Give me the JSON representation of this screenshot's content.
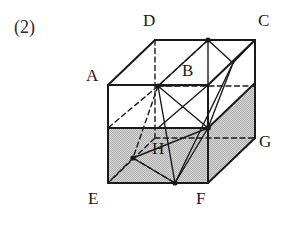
{
  "figure": {
    "part_label": "(2)",
    "shape_name": "rectangular-prism",
    "colors": {
      "stroke": "#1a1a1a",
      "hidden_stroke": "#1a1a1a",
      "shaded_face": "#c8c8c8",
      "background": "#ffffff",
      "label_text": "#1a1a1a"
    },
    "stroke_widths": {
      "solid_edge": 2.0,
      "thin_edge": 1.4,
      "hidden_edge": 1.4
    },
    "vertices": [
      {
        "id": "A",
        "label": "A",
        "x": 108,
        "y": 85,
        "label_x": 86,
        "label_y": 67,
        "hidden": false
      },
      {
        "id": "B",
        "label": "B",
        "x": 158,
        "y": 86,
        "label_x": 182,
        "label_y": 62,
        "hidden": true
      },
      {
        "id": "C",
        "label": "C",
        "x": 255,
        "y": 40,
        "label_x": 258,
        "label_y": 12,
        "hidden": false
      },
      {
        "id": "D",
        "label": "D",
        "x": 155,
        "y": 40,
        "label_x": 143,
        "label_y": 12,
        "hidden": false
      },
      {
        "id": "E",
        "label": "E",
        "x": 108,
        "y": 183,
        "label_x": 88,
        "label_y": 190,
        "hidden": false
      },
      {
        "id": "F",
        "label": "F",
        "x": 208,
        "y": 183,
        "label_x": 196,
        "label_y": 190,
        "hidden": false
      },
      {
        "id": "G",
        "label": "G",
        "x": 255,
        "y": 138,
        "label_x": 259,
        "label_y": 133,
        "hidden": false
      },
      {
        "id": "H",
        "label": "H",
        "x": 133,
        "y": 158,
        "label_x": 152,
        "label_y": 140,
        "hidden": true
      }
    ],
    "shaded_faces": [
      {
        "name": "front-lower-band",
        "points": "108,128 208,128 208,183 108,183"
      },
      {
        "name": "right-lower-band",
        "points": "208,128 255,83 255,138 208,183"
      }
    ],
    "solid_edges": [
      {
        "name": "edge-top-front-left",
        "x1": 108,
        "y1": 85,
        "x2": 155,
        "y2": 40
      },
      {
        "name": "edge-top-back",
        "x1": 155,
        "y1": 40,
        "x2": 255,
        "y2": 40
      },
      {
        "name": "edge-top-front",
        "x1": 108,
        "y1": 85,
        "x2": 208,
        "y2": 85
      },
      {
        "name": "edge-top-right",
        "x1": 208,
        "y1": 85,
        "x2": 255,
        "y2": 40
      },
      {
        "name": "edge-front-left-vert",
        "x1": 108,
        "y1": 85,
        "x2": 108,
        "y2": 183
      },
      {
        "name": "edge-front-right-vert",
        "x1": 208,
        "y1": 85,
        "x2": 208,
        "y2": 183
      },
      {
        "name": "edge-back-right-vert",
        "x1": 255,
        "y1": 40,
        "x2": 255,
        "y2": 138
      },
      {
        "name": "edge-bottom-front",
        "x1": 108,
        "y1": 183,
        "x2": 208,
        "y2": 183
      },
      {
        "name": "edge-bottom-right",
        "x1": 208,
        "y1": 183,
        "x2": 255,
        "y2": 138
      },
      {
        "name": "edge-midline-front",
        "x1": 108,
        "y1": 128,
        "x2": 208,
        "y2": 128
      },
      {
        "name": "edge-midline-right",
        "x1": 208,
        "y1": 128,
        "x2": 255,
        "y2": 83
      }
    ],
    "hidden_edges": [
      {
        "name": "hidden-back-left-vert",
        "x1": 155,
        "y1": 40,
        "x2": 155,
        "y2": 138
      },
      {
        "name": "hidden-back-bottom",
        "x1": 155,
        "y1": 138,
        "x2": 255,
        "y2": 138
      },
      {
        "name": "hidden-back-left-diag",
        "x1": 108,
        "y1": 183,
        "x2": 155,
        "y2": 138
      },
      {
        "name": "hidden-mid-back",
        "x1": 158,
        "y1": 86,
        "x2": 255,
        "y2": 86
      }
    ],
    "construction_solid": [
      {
        "name": "seg-B-to-top-node",
        "x1": 158,
        "y1": 86,
        "x2": 208,
        "y2": 40
      },
      {
        "name": "seg-topnode-to-mid",
        "x1": 208,
        "y1": 40,
        "x2": 233,
        "y2": 63
      },
      {
        "name": "seg-mid-to-C",
        "x1": 233,
        "y1": 63,
        "x2": 255,
        "y2": 40
      },
      {
        "name": "seg-topnode-down",
        "x1": 208,
        "y1": 40,
        "x2": 208,
        "y2": 128
      },
      {
        "name": "seg-B-to-F-node",
        "x1": 158,
        "y1": 86,
        "x2": 208,
        "y2": 128
      },
      {
        "name": "seg-B-down-to-F",
        "x1": 158,
        "y1": 86,
        "x2": 175,
        "y2": 183
      },
      {
        "name": "seg-A-node-diag",
        "x1": 158,
        "y1": 86,
        "x2": 208,
        "y2": 85
      },
      {
        "name": "seg-cross-right",
        "x1": 208,
        "y1": 85,
        "x2": 158,
        "y2": 128
      },
      {
        "name": "seg-Fnode-to-mid",
        "x1": 208,
        "y1": 128,
        "x2": 233,
        "y2": 63
      },
      {
        "name": "seg-Fnode-to-E-diag",
        "x1": 208,
        "y1": 128,
        "x2": 175,
        "y2": 183
      },
      {
        "name": "seg-Fnode-to-H",
        "x1": 208,
        "y1": 128,
        "x2": 133,
        "y2": 158
      },
      {
        "name": "seg-Fnode-down",
        "x1": 208,
        "y1": 128,
        "x2": 208,
        "y2": 183
      },
      {
        "name": "seg-H-to-bottom",
        "x1": 133,
        "y1": 158,
        "x2": 175,
        "y2": 183
      },
      {
        "name": "seg-bottom-to-mid",
        "x1": 175,
        "y1": 183,
        "x2": 233,
        "y2": 63
      }
    ],
    "construction_hidden": [
      {
        "name": "dash-D-to-B",
        "x1": 155,
        "y1": 40,
        "x2": 208,
        "y2": 40
      },
      {
        "name": "dash-topnode-to-B",
        "x1": 208,
        "y1": 40,
        "x2": 158,
        "y2": 86
      },
      {
        "name": "dash-B-to-E",
        "x1": 158,
        "y1": 86,
        "x2": 108,
        "y2": 128
      },
      {
        "name": "dash-B-to-H",
        "x1": 158,
        "y1": 86,
        "x2": 133,
        "y2": 158
      },
      {
        "name": "dash-H-to-Fbottom",
        "x1": 133,
        "y1": 158,
        "x2": 175,
        "y2": 183
      },
      {
        "name": "dash-H-to-left",
        "x1": 133,
        "y1": 158,
        "x2": 108,
        "y2": 183
      }
    ],
    "node_dots": [
      {
        "name": "node-B",
        "x": 158,
        "y": 86,
        "r": 2.6
      },
      {
        "name": "node-top-apex",
        "x": 208,
        "y": 40,
        "r": 2.6
      },
      {
        "name": "node-front-hub",
        "x": 208,
        "y": 128,
        "r": 2.8
      },
      {
        "name": "node-H",
        "x": 133,
        "y": 158,
        "r": 2.6
      },
      {
        "name": "node-bottom",
        "x": 175,
        "y": 183,
        "r": 2.6
      }
    ]
  }
}
